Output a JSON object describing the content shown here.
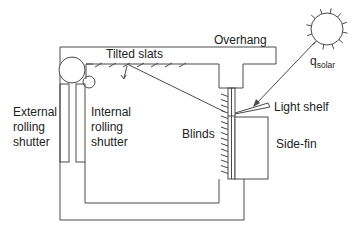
{
  "diagram": {
    "labels": {
      "tilted_slats": "Tilted slats",
      "overhang": "Overhang",
      "q_solar_main": "q",
      "q_solar_sub": "solar",
      "light_shelf": "Light shelf",
      "blinds": "Blinds",
      "side_fin": "Side-fin",
      "external_shutter": [
        "External",
        "rolling",
        "shutter"
      ],
      "internal_shutter": [
        "Internal",
        "rolling",
        "shutter"
      ]
    },
    "colors": {
      "line": "#4a4a4a",
      "text": "#222222",
      "background": "#ffffff"
    }
  }
}
